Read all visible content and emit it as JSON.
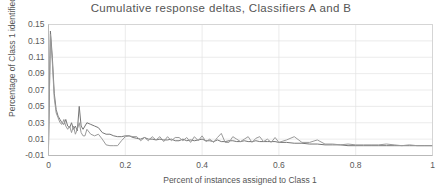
{
  "chart_data": {
    "type": "line",
    "title": "Cumulative response deltas, Classifiers A and B",
    "xlabel": "Percent of instances assigned to Class 1",
    "ylabel": "Percentage of Class 1 identified",
    "xlim": [
      0,
      1
    ],
    "ylim": [
      -0.01,
      0.15
    ],
    "xticks": [
      "0",
      "0.2",
      "0.4",
      "0.6",
      "0.8",
      "1"
    ],
    "xtick_values": [
      0,
      0.2,
      0.4,
      0.6,
      0.8,
      1
    ],
    "yticks": [
      "-0.01",
      "0.01",
      "0.03",
      "0.05",
      "0.07",
      "0.09",
      "0.11",
      "0.13",
      "0.15"
    ],
    "ytick_values": [
      -0.01,
      0.01,
      0.03,
      0.05,
      0.07,
      0.09,
      0.11,
      0.13,
      0.15
    ],
    "grid": true,
    "legend": "none",
    "colors": {
      "series_a": "#7f7f7f",
      "series_b": "#a6a6a6",
      "gridline": "#e2e2e2",
      "axis": "#b5b5b5",
      "text": "#595959",
      "background": "#ffffff"
    },
    "series": [
      {
        "name": "Classifier A",
        "color": "#767676",
        "x": [
          0.0,
          0.005,
          0.01,
          0.015,
          0.02,
          0.025,
          0.03,
          0.035,
          0.04,
          0.045,
          0.05,
          0.055,
          0.06,
          0.065,
          0.07,
          0.075,
          0.08,
          0.085,
          0.09,
          0.095,
          0.1,
          0.11,
          0.12,
          0.13,
          0.14,
          0.15,
          0.16,
          0.17,
          0.18,
          0.19,
          0.2,
          0.21,
          0.22,
          0.23,
          0.24,
          0.25,
          0.26,
          0.27,
          0.28,
          0.29,
          0.3,
          0.31,
          0.32,
          0.33,
          0.34,
          0.35,
          0.36,
          0.37,
          0.38,
          0.39,
          0.4,
          0.41,
          0.42,
          0.43,
          0.44,
          0.45,
          0.46,
          0.47,
          0.48,
          0.49,
          0.5,
          0.51,
          0.52,
          0.53,
          0.54,
          0.55,
          0.56,
          0.57,
          0.58,
          0.59,
          0.6,
          0.62,
          0.64,
          0.66,
          0.68,
          0.7,
          0.72,
          0.74,
          0.76,
          0.78,
          0.8,
          0.82,
          0.84,
          0.86,
          0.88,
          0.9,
          0.92,
          0.94,
          0.96,
          0.98,
          1.0
        ],
        "y": [
          0.0,
          0.142,
          0.11,
          0.066,
          0.046,
          0.038,
          0.034,
          0.03,
          0.028,
          0.034,
          0.026,
          0.024,
          0.03,
          0.022,
          0.026,
          0.02,
          0.05,
          0.026,
          0.022,
          0.026,
          0.03,
          0.028,
          0.026,
          0.024,
          0.018,
          0.016,
          0.016,
          0.014,
          0.013,
          0.013,
          0.014,
          0.014,
          0.012,
          0.011,
          0.01,
          0.012,
          0.01,
          0.01,
          0.009,
          0.01,
          0.009,
          0.009,
          0.01,
          0.008,
          0.008,
          0.01,
          0.008,
          0.009,
          0.008,
          0.009,
          0.01,
          0.008,
          0.008,
          0.007,
          0.009,
          0.007,
          0.007,
          0.008,
          0.008,
          0.007,
          0.007,
          0.008,
          0.007,
          0.007,
          0.008,
          0.007,
          0.007,
          0.007,
          0.007,
          0.007,
          0.006,
          0.006,
          0.005,
          0.005,
          0.004,
          0.004,
          0.003,
          0.003,
          0.003,
          0.002,
          0.002,
          0.002,
          0.002,
          0.002,
          0.002,
          0.002,
          0.002,
          0.002,
          0.002,
          0.002,
          0.002
        ]
      },
      {
        "name": "Classifier B",
        "color": "#9a9a9a",
        "x": [
          0.0,
          0.005,
          0.01,
          0.015,
          0.02,
          0.025,
          0.03,
          0.035,
          0.04,
          0.045,
          0.05,
          0.055,
          0.06,
          0.065,
          0.07,
          0.075,
          0.08,
          0.085,
          0.09,
          0.095,
          0.1,
          0.11,
          0.12,
          0.13,
          0.14,
          0.15,
          0.16,
          0.17,
          0.18,
          0.19,
          0.2,
          0.21,
          0.22,
          0.23,
          0.24,
          0.25,
          0.26,
          0.27,
          0.28,
          0.29,
          0.3,
          0.31,
          0.32,
          0.33,
          0.34,
          0.35,
          0.36,
          0.37,
          0.38,
          0.39,
          0.4,
          0.41,
          0.42,
          0.43,
          0.44,
          0.45,
          0.46,
          0.47,
          0.48,
          0.49,
          0.5,
          0.51,
          0.52,
          0.53,
          0.54,
          0.55,
          0.56,
          0.57,
          0.58,
          0.59,
          0.6,
          0.62,
          0.64,
          0.66,
          0.68,
          0.7,
          0.72,
          0.74,
          0.76,
          0.78,
          0.8,
          0.82,
          0.84,
          0.86,
          0.88,
          0.9,
          0.92,
          0.94,
          0.96,
          0.98,
          1.0
        ],
        "y": [
          0.0,
          0.138,
          0.104,
          0.06,
          0.042,
          0.036,
          0.03,
          0.028,
          0.034,
          0.026,
          0.022,
          0.026,
          0.018,
          0.026,
          0.016,
          0.022,
          0.03,
          0.018,
          0.014,
          0.014,
          0.022,
          0.016,
          0.014,
          0.016,
          0.01,
          0.003,
          0.002,
          0.002,
          0.002,
          0.008,
          0.013,
          0.014,
          0.013,
          0.013,
          0.008,
          0.012,
          0.008,
          0.013,
          0.009,
          0.013,
          0.007,
          0.013,
          0.008,
          0.012,
          0.012,
          0.008,
          0.012,
          0.006,
          0.013,
          0.008,
          0.014,
          0.007,
          0.01,
          0.006,
          0.012,
          0.017,
          0.006,
          0.006,
          0.013,
          0.01,
          0.007,
          0.01,
          0.013,
          0.006,
          0.011,
          0.013,
          0.007,
          0.01,
          0.006,
          0.012,
          0.006,
          0.009,
          0.013,
          0.006,
          0.006,
          0.009,
          0.004,
          0.004,
          0.003,
          0.004,
          0.003,
          0.003,
          0.003,
          0.003,
          0.004,
          0.003,
          0.002,
          0.003,
          0.002,
          0.002,
          0.002
        ]
      }
    ]
  }
}
